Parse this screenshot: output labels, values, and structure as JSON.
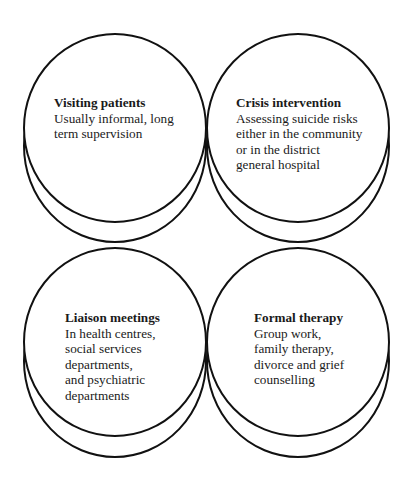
{
  "diagram": {
    "type": "four stacked-disc nodes in a 2x2 grid",
    "nodes": [
      {
        "id": "visiting-patients",
        "title": "Visiting patients",
        "lines": [
          "Usually informal, long",
          "term supervision"
        ]
      },
      {
        "id": "crisis-intervention",
        "title": "Crisis intervention",
        "lines": [
          "Assessing suicide risks",
          "either in the community",
          "or in the district",
          "general hospital"
        ]
      },
      {
        "id": "liaison-meetings",
        "title": "Liaison meetings",
        "lines": [
          "In health centres,",
          "social services",
          "departments,",
          "and psychiatric",
          "departments"
        ]
      },
      {
        "id": "formal-therapy",
        "title": "Formal therapy",
        "lines": [
          "Group work,",
          "family therapy,",
          "divorce and grief",
          "counselling"
        ]
      }
    ]
  },
  "colors": {
    "stroke": "#111111",
    "background": "#ffffff",
    "text": "#1a1a1a"
  }
}
